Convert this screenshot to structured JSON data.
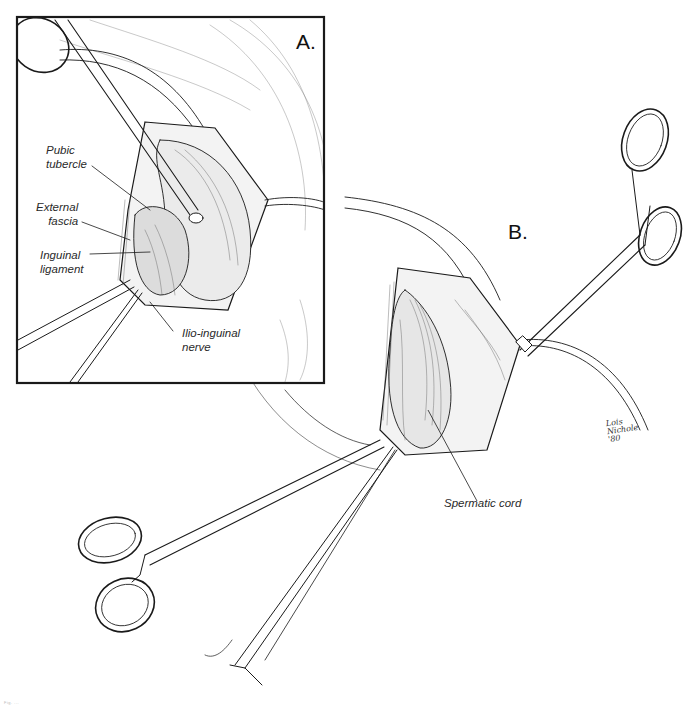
{
  "figure": {
    "panels": [
      {
        "letter": "A.",
        "labels": {
          "pubic_tubercle": "Pubic\ntubercle",
          "external_fascia": "External\nfascia",
          "inguinal_ligament": "Inguinal\nligament",
          "ilio_inguinal_nerve": "Ilio-inguinal\nnerve"
        }
      },
      {
        "letter": "B.",
        "labels": {
          "spermatic_cord": "Spermatic cord"
        }
      }
    ],
    "signature": "Lois\nNichole\n'80",
    "caption": "Fig. ..."
  },
  "colors": {
    "ink": "#1a1a1a",
    "background": "#ffffff"
  }
}
